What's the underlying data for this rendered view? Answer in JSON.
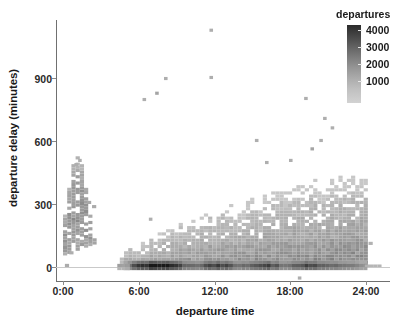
{
  "chart_data": {
    "type": "heatmap",
    "title": "",
    "subtitle": "",
    "xlabel": "departure time",
    "ylabel": "departure delay (minutes)",
    "xtick_labels": [
      "0:00",
      "6:00",
      "12:00",
      "18:00",
      "24:00"
    ],
    "xtick_values": [
      0,
      6,
      12,
      18,
      24
    ],
    "ytick_labels": [
      "0",
      "300",
      "600",
      "900"
    ],
    "ytick_values": [
      0,
      300,
      600,
      900
    ],
    "xlim": [
      -0.9,
      25.4
    ],
    "ylim": [
      -75,
      1185
    ],
    "grid": false,
    "legend_position": "top-right",
    "colorbar": {
      "label": "departures",
      "tick_labels": [
        "4000",
        "3000",
        "2000",
        "1000"
      ],
      "tick_values": [
        4000,
        3000,
        2000,
        1000
      ],
      "vmin": 0,
      "vmax": 4500,
      "low_color": "#d6d6d6",
      "high_color": "#1e1e1e",
      "orientation": "vertical"
    },
    "bin_width_hours": 0.333,
    "bin_height_minutes": 15,
    "notable_points": [
      {
        "x": 11.6,
        "y": 1120,
        "count": 1,
        "note": "maximum delay outlier"
      },
      {
        "x": 11.6,
        "y": 895,
        "count": 1
      },
      {
        "x": 8.0,
        "y": 890,
        "count": 1
      },
      {
        "x": 7.3,
        "y": 820,
        "count": 2
      },
      {
        "x": 6.3,
        "y": 790,
        "count": 1
      },
      {
        "x": 19.1,
        "y": 795,
        "count": 1
      },
      {
        "x": 20.6,
        "y": 700,
        "count": 1
      },
      {
        "x": 21.2,
        "y": 655,
        "count": 1
      },
      {
        "x": 15.2,
        "y": 595,
        "count": 1
      },
      {
        "x": 20.3,
        "y": 595,
        "count": 1
      },
      {
        "x": 19.6,
        "y": 555,
        "count": 2
      },
      {
        "x": 17.9,
        "y": 500,
        "count": 1
      },
      {
        "x": 16.0,
        "y": 490,
        "count": 1
      },
      {
        "x": 1.2,
        "y": 500,
        "count": 1
      },
      {
        "x": 0.9,
        "y": 480,
        "count": 1
      },
      {
        "x": 6.8,
        "y": 220,
        "count": 1
      },
      {
        "x": 18.6,
        "y": -60,
        "count": 1,
        "note": "early departure outlier"
      }
    ],
    "series_summary": [
      {
        "name": "near-zero-delay band",
        "x_range": [
          4.8,
          24.0
        ],
        "y_range": [
          -15,
          25
        ],
        "peak_count": 4400
      },
      {
        "name": "delay wedge",
        "x_range": [
          4.5,
          24.0
        ],
        "y_range": [
          0,
          430
        ],
        "typical_count": 450
      },
      {
        "name": "midnight cluster",
        "x_range": [
          0.0,
          2.6
        ],
        "y_range": [
          55,
          500
        ],
        "typical_count": 400
      }
    ]
  }
}
